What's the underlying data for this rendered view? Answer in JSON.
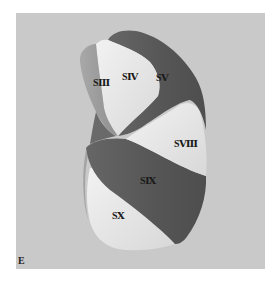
{
  "figure": {
    "panel_label": "E",
    "colors": {
      "background": "#c9c9c9",
      "dark_segment": "#5c5c5c",
      "mid_segment": "#9b9b9b",
      "light_segment": "#e9e9e9"
    },
    "segments": [
      {
        "id": "s3",
        "label": "SⅢ",
        "shade": "mid"
      },
      {
        "id": "s4",
        "label": "SⅣ",
        "shade": "light"
      },
      {
        "id": "s5",
        "label": "SⅤ",
        "shade": "dark"
      },
      {
        "id": "s8",
        "label": "SⅧ",
        "shade": "light"
      },
      {
        "id": "s9",
        "label": "SⅨ",
        "shade": "dark"
      },
      {
        "id": "s10",
        "label": "SⅩ",
        "shade": "light"
      }
    ]
  }
}
